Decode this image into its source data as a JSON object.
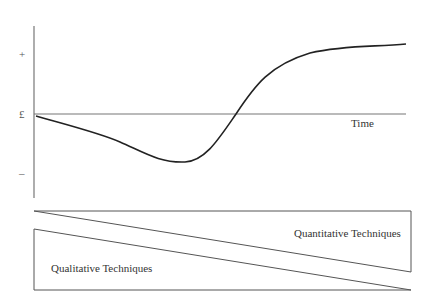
{
  "diagram": {
    "type": "line-with-wedge-diagram",
    "y_axis_labels": {
      "positive": "+",
      "zero": "£",
      "negative": "–"
    },
    "x_axis_label": "Time",
    "curve_description": "J-curve: declines from zero to a trough, then rises steeply, crosses zero and levels off in positive territory",
    "wedges": {
      "upper": "Quantitative Techniques",
      "lower": "Qualitative Techniques"
    },
    "colors": {
      "curve": "#222222",
      "axis": "#777777",
      "wedge": "#555555",
      "background": "#ffffff"
    }
  }
}
